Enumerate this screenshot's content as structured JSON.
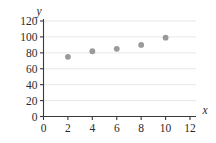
{
  "chart_data": {
    "type": "scatter",
    "title": "",
    "subtitle": "",
    "xlabel": "x",
    "ylabel": "y",
    "xlim": [
      0,
      12
    ],
    "ylim": [
      0,
      120
    ],
    "x_ticks": [
      0,
      2,
      4,
      6,
      8,
      10,
      12
    ],
    "y_ticks": [
      0,
      20,
      40,
      60,
      80,
      100,
      120
    ],
    "x_tick_labels": [
      "0",
      "2",
      "4",
      "6",
      "8",
      "10",
      "12"
    ],
    "y_tick_labels": [
      "0",
      "20",
      "40",
      "60",
      "80",
      "100",
      "120"
    ],
    "grid": "horizontal",
    "legend": "none",
    "series": [
      {
        "name": "data",
        "marker": "circle",
        "color": "#9a9a9a",
        "x": [
          2,
          4,
          6,
          8,
          10
        ],
        "y": [
          75,
          82,
          85,
          90,
          99
        ],
        "points": [
          {
            "x": 2,
            "y": 75
          },
          {
            "x": 4,
            "y": 82
          },
          {
            "x": 6,
            "y": 85
          },
          {
            "x": 8,
            "y": 90
          },
          {
            "x": 10,
            "y": 99
          }
        ]
      }
    ],
    "annotations": []
  },
  "colors": {
    "background": "#ffffff",
    "axis": "#3a3a3a",
    "grid": "#e3e3e3",
    "marker": "#9a9a9a",
    "text": "#2b2b2b"
  }
}
